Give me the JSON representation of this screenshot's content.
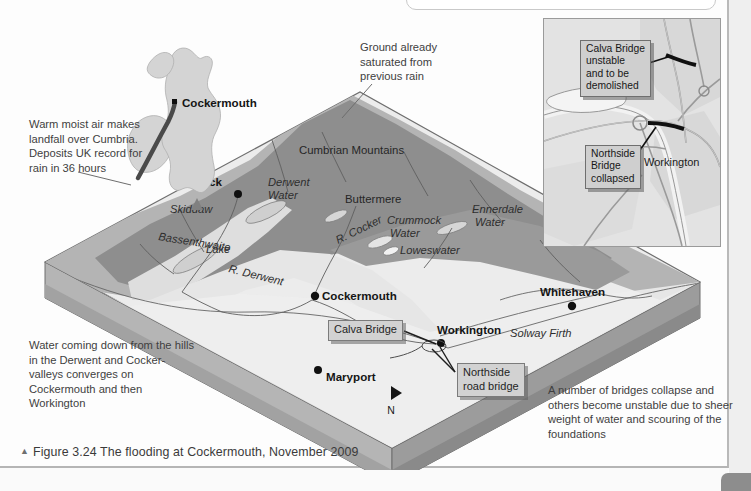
{
  "caption": {
    "marker": "▲",
    "text": "Figure 3.24 The flooding at Cockermouth, November 2009"
  },
  "annotations": {
    "warm_air": "Warm moist air makes landfall over Cumbria. Deposits UK record for rain in 36 hours",
    "ground_saturated": "Ground already saturated from previous rain",
    "water_converges": "Water coming down from the hills in the Derwent and Cocker-valleys converges on Cockermouth and then Workington",
    "bridges_collapse": "A number of bridges collapse and others become unstable due to sheer weight of water and scouring of the foundations"
  },
  "callouts": {
    "calva_bridge_main": "Calva Bridge",
    "northside_road_bridge_main": "Northside\nroad bridge",
    "calva_bridge_inset": "Calva Bridge\nunstable\nand to be\ndemolished",
    "northside_bridge_inset": "Northside\nBridge\ncollapsed"
  },
  "inset": {
    "workington": "Workington"
  },
  "uk_inset": {
    "cockermouth": "Cockermouth"
  },
  "map_labels": {
    "towns": [
      {
        "name": "Keswick",
        "x": 222,
        "y": 186,
        "anchor": "end",
        "dot_x": 238,
        "dot_y": 194
      },
      {
        "name": "Cockermouth",
        "x": 322,
        "y": 300,
        "anchor": "start",
        "dot_x": 315,
        "dot_y": 296
      },
      {
        "name": "Whitehaven",
        "x": 540,
        "y": 296,
        "anchor": "start",
        "dot_x": 572,
        "dot_y": 306
      },
      {
        "name": "Workington",
        "x": 437,
        "y": 334,
        "anchor": "start",
        "dot_x": 441,
        "dot_y": 343
      },
      {
        "name": "Maryport",
        "x": 326,
        "y": 381,
        "anchor": "start",
        "dot_x": 318,
        "dot_y": 370
      }
    ],
    "waters": [
      {
        "name": "Derwent",
        "x": 268,
        "y": 186
      },
      {
        "name": "Water",
        "x": 268,
        "y": 199
      },
      {
        "name": "Crummock",
        "x": 387,
        "y": 224
      },
      {
        "name": "Water",
        "x": 390,
        "y": 237
      },
      {
        "name": "Ennerdale",
        "x": 472,
        "y": 213
      },
      {
        "name": "Water",
        "x": 475,
        "y": 226
      },
      {
        "name": "Loweswater",
        "x": 400,
        "y": 254
      },
      {
        "name": "R. Derwent",
        "x": 228,
        "y": 272
      },
      {
        "name": "R. Cocker",
        "x": 338,
        "y": 244
      },
      {
        "name": "Bassenthwaite",
        "x": 158,
        "y": 240
      },
      {
        "name": "Lake",
        "x": 206,
        "y": 253
      },
      {
        "name": "Skiddaw",
        "x": 170,
        "y": 213
      },
      {
        "name": "Solway Firth",
        "x": 510,
        "y": 337
      }
    ],
    "areas": [
      {
        "name": "Cumbrian Mountains",
        "x": 299,
        "y": 154
      },
      {
        "name": "Buttermere",
        "x": 345,
        "y": 203
      }
    ],
    "north": "N"
  },
  "colors": {
    "upland_dark": "#8e8e8e",
    "upland_mid": "#a8a8a8",
    "lowland_light": "#e0e0e0",
    "lowland_pale": "#eeeeee",
    "water": "#c8c8c8",
    "block_side": "#9c9c9c",
    "block_side_dark": "#8a8a8a",
    "callout_fill": "#d2d2d2",
    "inset_bg": "#e3e3e3",
    "text": "#3a3a3a"
  }
}
